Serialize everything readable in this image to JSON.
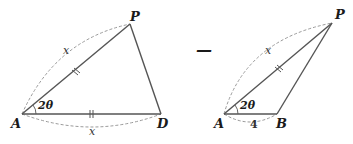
{
  "diagram": {
    "left_triangle": {
      "vertices": [
        {
          "name": "A",
          "x": 22,
          "y": 114
        },
        {
          "name": "P",
          "x": 130,
          "y": 24
        },
        {
          "name": "D",
          "x": 161,
          "y": 114
        }
      ],
      "angle_label": "2θ",
      "arc_labels": [
        "x",
        "x"
      ],
      "equal_marks": [
        "AP",
        "AD"
      ]
    },
    "operator": "—",
    "right_triangle": {
      "vertices": [
        {
          "name": "A",
          "x": 224,
          "y": 114
        },
        {
          "name": "P",
          "x": 332,
          "y": 23
        },
        {
          "name": "B",
          "x": 277,
          "y": 114
        }
      ],
      "angle_label": "2θ",
      "arc_labels": [
        "x",
        "4"
      ],
      "equal_marks": [
        "AP"
      ]
    },
    "colors": {
      "edge": "#555555",
      "dashed_arc": "#9a9a9a",
      "text": "#1a1a1a"
    }
  }
}
